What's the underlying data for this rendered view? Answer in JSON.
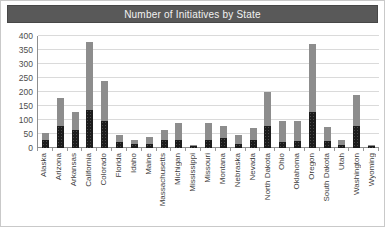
{
  "window": {
    "title": "Number of Initiatives by State"
  },
  "colors": {
    "title_bar_bg": "#595959",
    "title_text": "#f2f2f2",
    "gridline": "#dadada",
    "axis_line": "#8f8f8f",
    "series_dark": "#1c1c1c",
    "series_gray": "#8d8d8d",
    "tick_label": "#4d4d4d"
  },
  "chart_data": {
    "type": "bar",
    "stacked": true,
    "title": "Number of Initiatives by State",
    "xlabel": "",
    "ylabel": "",
    "ylim": [
      0,
      400
    ],
    "yticks": [
      0,
      50,
      100,
      150,
      200,
      250,
      300,
      350,
      400
    ],
    "grid": true,
    "legend": "none",
    "x_label_rotation": 90,
    "categories": [
      "Alaska",
      "Arizona",
      "Arkansas",
      "California",
      "Colorado",
      "Florida",
      "Idaho",
      "Maine",
      "Massachusetts",
      "Michigan",
      "Mississippi",
      "Missouri",
      "Montana",
      "Nebraska",
      "Nevada",
      "North Dakota",
      "Ohio",
      "Oklahoma",
      "Oregon",
      "South Dakota",
      "Utah",
      "Washington",
      "Wyoming"
    ],
    "series": [
      {
        "name": "bottom-dark",
        "color": "#1c1c1c",
        "values": [
          30,
          80,
          65,
          135,
          95,
          20,
          15,
          15,
          30,
          30,
          6,
          30,
          35,
          15,
          30,
          80,
          20,
          25,
          130,
          25,
          10,
          80,
          8
        ]
      },
      {
        "name": "top-gray",
        "color": "#8d8d8d",
        "values": [
          25,
          100,
          65,
          245,
          145,
          25,
          15,
          25,
          35,
          60,
          4,
          60,
          45,
          30,
          40,
          120,
          75,
          70,
          240,
          50,
          20,
          110,
          4
        ]
      }
    ],
    "totals": [
      55,
      180,
      130,
      380,
      240,
      45,
      30,
      40,
      65,
      90,
      10,
      90,
      80,
      45,
      70,
      200,
      95,
      95,
      370,
      75,
      30,
      190,
      12
    ]
  }
}
